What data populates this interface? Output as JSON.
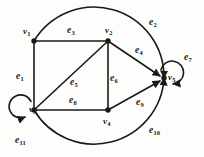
{
  "figure": {
    "background_color": "#fdfdfb",
    "stroke_color": "#1a1a1a",
    "width": 204,
    "height": 157
  },
  "vertices": [
    {
      "id": "v1",
      "label": "v",
      "sub": "1",
      "x": 34,
      "y": 41,
      "label_x": 23,
      "label_y": 27,
      "loop": false
    },
    {
      "id": "v2",
      "label": "v",
      "sub": "2",
      "x": 108,
      "y": 41,
      "label_x": 105,
      "label_y": 26,
      "loop": false
    },
    {
      "id": "v3",
      "label": "v",
      "sub": "3",
      "x": 34,
      "y": 110,
      "label_x": 29,
      "label_y": 113,
      "loop": true
    },
    {
      "id": "v4",
      "label": "v",
      "sub": "4",
      "x": 108,
      "y": 110,
      "label_x": 103,
      "label_y": 121,
      "loop": false
    },
    {
      "id": "v5",
      "label": "v",
      "sub": "5",
      "x": 164,
      "y": 78,
      "label_x": 168,
      "label_y": 75,
      "loop": true
    }
  ],
  "edges": [
    {
      "id": "e1",
      "label": "e",
      "sub": "1",
      "from": "v1",
      "to": "v3",
      "shape": "line",
      "label_x": 17,
      "label_y": 72
    },
    {
      "id": "e2",
      "label": "e",
      "sub": "2",
      "from": "v1",
      "to": "v5",
      "shape": "arc-top",
      "label_x": 150,
      "label_y": 18
    },
    {
      "id": "e3",
      "label": "e",
      "sub": "3",
      "from": "v1",
      "to": "v2",
      "shape": "line",
      "label_x": 68,
      "label_y": 27
    },
    {
      "id": "e4",
      "label": "e",
      "sub": "4",
      "from": "v2",
      "to": "v5",
      "shape": "line",
      "label_x": 136,
      "label_y": 47
    },
    {
      "id": "e5",
      "label": "e",
      "sub": "5",
      "from": "v3",
      "to": "v2",
      "shape": "line",
      "label_x": 71,
      "label_y": 78
    },
    {
      "id": "e6",
      "label": "e",
      "sub": "6",
      "from": "v2",
      "to": "v4",
      "shape": "line",
      "label_x": 109,
      "label_y": 74
    },
    {
      "id": "e7",
      "label": "e",
      "sub": "7",
      "from": "v5",
      "to": "v5",
      "shape": "self-loop",
      "label_x": 185,
      "label_y": 54
    },
    {
      "id": "e8",
      "label": "e",
      "sub": "8",
      "from": "v3",
      "to": "v4",
      "shape": "line",
      "label_x": 70,
      "label_y": 96
    },
    {
      "id": "e9",
      "label": "e",
      "sub": "9",
      "from": "v4",
      "to": "v5",
      "shape": "line",
      "label_x": 137,
      "label_y": 98
    },
    {
      "id": "e10",
      "label": "e",
      "sub": "10",
      "from": "v3",
      "to": "v5",
      "shape": "arc-bottom",
      "label_x": 150,
      "label_y": 126
    },
    {
      "id": "e11",
      "label": "e",
      "sub": "11",
      "from": "v3",
      "to": "v3",
      "shape": "self-loop",
      "label_x": 16,
      "label_y": 136
    }
  ],
  "geometry": {
    "outer_arc_top_path": "M 34 41 A 68 68 0 0 1 164 78",
    "outer_arc_bottom_path": "M 34 110 A 68 68 0 0 0 164 78",
    "loop_v5_path": "M 160 70 A 11.5 11.5 0 1 1 172 86",
    "loop_v3_path": "M 30 102 A 11.5 11.5 0 1 0 26 118",
    "dot_radius": 2.6,
    "line_width": 1.6
  }
}
